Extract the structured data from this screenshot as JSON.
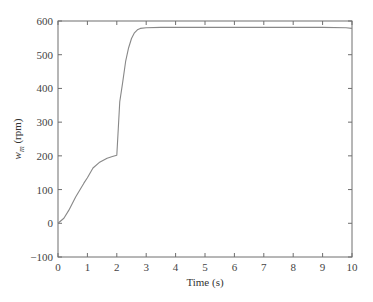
{
  "chart_data": {
    "type": "line",
    "title": "",
    "xlabel": "Time (s)",
    "ylabel": "w_m (rpm)",
    "ylabel_main": "w",
    "ylabel_sub": "m",
    "ylabel_unit": " (rpm)",
    "xlim": [
      0,
      10
    ],
    "ylim": [
      -100,
      600
    ],
    "xticks": [
      0,
      1,
      2,
      3,
      4,
      5,
      6,
      7,
      8,
      9,
      10
    ],
    "yticks": [
      -100,
      0,
      100,
      200,
      300,
      400,
      500,
      600
    ],
    "ytick_labels": [
      "−100",
      "0",
      "100",
      "200",
      "300",
      "400",
      "500",
      "600"
    ],
    "grid": false,
    "legend": null,
    "line_color": "#888888",
    "series": [
      {
        "name": "w_m",
        "x": [
          0,
          0.2,
          0.37,
          0.6,
          0.88,
          1.0,
          1.19,
          1.4,
          1.67,
          1.85,
          2.0,
          2.05,
          2.1,
          2.2,
          2.3,
          2.4,
          2.5,
          2.6,
          2.7,
          2.8,
          3.0,
          3.5,
          4,
          5,
          6,
          7,
          8,
          9,
          9.8,
          10
        ],
        "values": [
          0,
          15,
          39,
          78,
          119,
          135,
          164,
          180,
          193,
          198,
          202,
          280,
          360,
          418,
          480,
          520,
          548,
          565,
          574,
          578,
          580,
          581,
          581,
          581,
          581,
          581,
          581,
          581,
          580,
          578
        ]
      }
    ]
  }
}
